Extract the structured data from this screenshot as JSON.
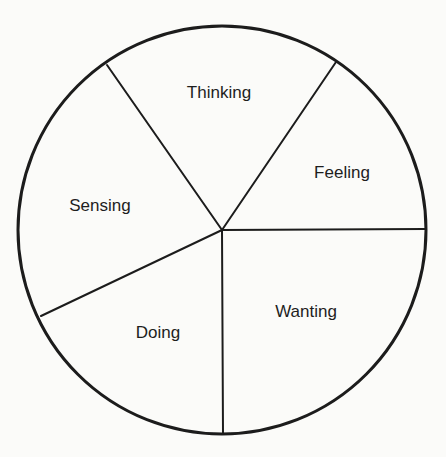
{
  "diagram": {
    "type": "pie-diagram",
    "center": [
      222,
      230
    ],
    "radius": 204,
    "colors": {
      "background": "#fbfbf9",
      "stroke": "#1c1c1c",
      "text": "#1e1e1e"
    },
    "sectors": [
      {
        "label": "Thinking",
        "start_deg": 325.1,
        "end_deg": 34.2,
        "label_pos": [
          219,
          94
        ]
      },
      {
        "label": "Feeling",
        "start_deg": 34.2,
        "end_deg": 90.0,
        "label_pos": [
          342,
          174
        ]
      },
      {
        "label": "Wanting",
        "start_deg": 90.0,
        "end_deg": 180.0,
        "label_pos": [
          306,
          313
        ]
      },
      {
        "label": "Doing",
        "start_deg": 180.0,
        "end_deg": 244.6,
        "label_pos": [
          158,
          334
        ]
      },
      {
        "label": "Sensing",
        "start_deg": 244.6,
        "end_deg": 325.1,
        "label_pos": [
          100,
          207
        ]
      }
    ],
    "dividers": [
      {
        "from": [
          222,
          230
        ],
        "to": [
          107,
          65
        ]
      },
      {
        "from": [
          222,
          230
        ],
        "to": [
          336,
          62
        ]
      },
      {
        "from": [
          222,
          230
        ],
        "to": [
          425,
          229
        ]
      },
      {
        "from": [
          222,
          230
        ],
        "to": [
          223,
          434
        ]
      },
      {
        "from": [
          222,
          230
        ],
        "to": [
          41,
          316
        ]
      }
    ]
  }
}
